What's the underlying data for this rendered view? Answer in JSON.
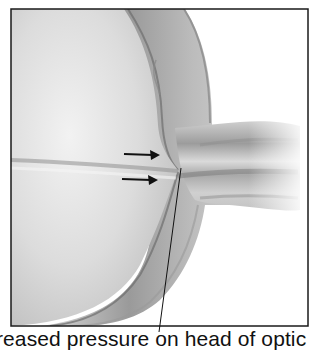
{
  "figure": {
    "caption": "reased pressure on head of optic",
    "frame": {
      "x": 11,
      "y": 9,
      "width": 297,
      "height": 317,
      "stroke": "#1a1a1a"
    },
    "colors": {
      "background": "#ffffff",
      "eyeball_light": "#e8e8e8",
      "eyeball_mid": "#c9c9c9",
      "wall_dark": "#8a8a8a",
      "wall_mid": "#b0b0b0",
      "nerve_light": "#d4d4d4",
      "arrow": "#111111",
      "text": "#111111"
    },
    "annotations": [
      {
        "type": "arrow",
        "label": "upper-pressure-arrow",
        "from": [
          124,
          154
        ],
        "to": [
          159,
          155
        ]
      },
      {
        "type": "arrow",
        "label": "lower-pressure-arrow",
        "from": [
          122,
          179
        ],
        "to": [
          158,
          180
        ]
      },
      {
        "type": "leader-line",
        "label": "caption-leader",
        "from": [
          180,
          170
        ],
        "to": [
          159,
          331
        ]
      }
    ]
  }
}
